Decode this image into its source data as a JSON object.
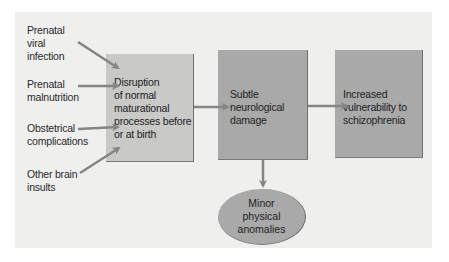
{
  "diagram": {
    "inputs": [
      {
        "id": "prenatal-viral-infection",
        "lines": [
          "Prenatal",
          "viral",
          "infection"
        ]
      },
      {
        "id": "prenatal-malnutrition",
        "lines": [
          "Prenatal",
          "malnutrition"
        ]
      },
      {
        "id": "obstetrical-complications",
        "lines": [
          "Obstetrical",
          "complications"
        ]
      },
      {
        "id": "other-brain-insults",
        "lines": [
          "Other brain",
          "insults"
        ]
      }
    ],
    "boxes": [
      {
        "id": "disruption",
        "lines": [
          "Disruption",
          "of normal",
          "maturational",
          "processes before",
          "or at birth"
        ]
      },
      {
        "id": "subtle-damage",
        "lines": [
          "Subtle",
          "neurological",
          "damage"
        ]
      },
      {
        "id": "vulnerability",
        "lines": [
          "Increased",
          "vulnerability to",
          "schizophrenia"
        ]
      }
    ],
    "outcome": {
      "id": "minor-anomalies",
      "lines": [
        "Minor",
        "physical",
        "anomalies"
      ]
    },
    "colors": {
      "panel": "#efefee",
      "box_light": "#c9c9c8",
      "box_dark": "#a9a9a9",
      "arrow": "#858585"
    }
  }
}
